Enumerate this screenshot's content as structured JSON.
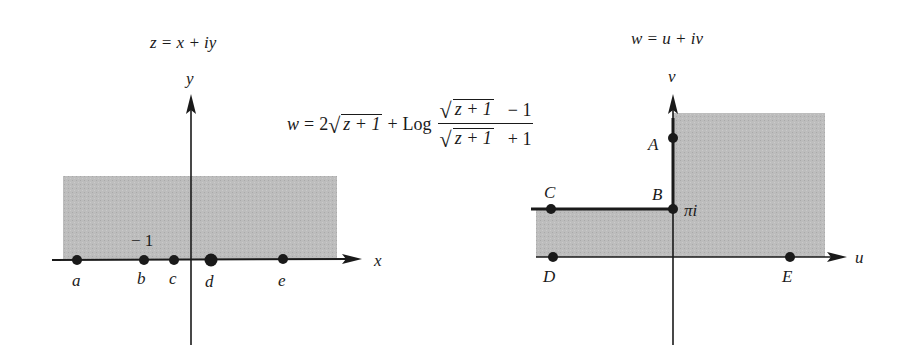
{
  "left_plane": {
    "title": "z = x + iy",
    "x_axis_label": "x",
    "y_axis_label": "y",
    "tick_label": "− 1",
    "points": [
      {
        "label": "a",
        "x": 77
      },
      {
        "label": "b",
        "x": 144
      },
      {
        "label": "c",
        "x": 174
      },
      {
        "label": "d",
        "x": 211
      },
      {
        "label": "e",
        "x": 283
      }
    ],
    "region": "upper half-plane (shaded)"
  },
  "mapping": {
    "lhs": "w",
    "equals": "=",
    "coef": "2",
    "radicand": "z + 1",
    "plus": "+",
    "log": "Log",
    "numerator_tail": "− 1",
    "denominator_tail": "+ 1"
  },
  "right_plane": {
    "title": "w = u + iv",
    "u_axis_label": "u",
    "v_axis_label": "v",
    "pi_i_label": "πi",
    "points": [
      {
        "label": "A"
      },
      {
        "label": "B"
      },
      {
        "label": "C"
      },
      {
        "label": "D"
      },
      {
        "label": "E"
      }
    ],
    "region": "half-strip plus first quadrant (shaded)"
  },
  "colors": {
    "shade": "#b8b8b8",
    "ink": "#1a1a1a",
    "background": "#ffffff"
  }
}
